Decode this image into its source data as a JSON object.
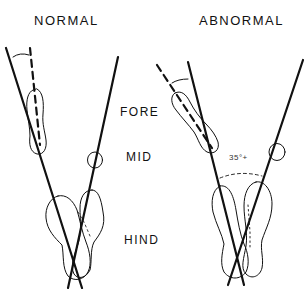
{
  "diagram": {
    "titles": {
      "normal": "NORMAL",
      "abnormal": "ABNORMAL"
    },
    "regions": {
      "fore": "FORE",
      "mid": "MID",
      "hind": "HIND"
    },
    "angle_label": "35°+",
    "colors": {
      "line": "#111111",
      "background": "#ffffff"
    }
  }
}
